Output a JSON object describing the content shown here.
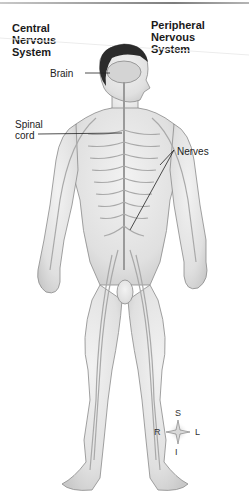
{
  "headings": {
    "central": [
      "Central",
      "Nervous",
      "System"
    ],
    "peripheral": [
      "Peripheral",
      "Nervous",
      "System"
    ]
  },
  "labels": {
    "brain": "Brain",
    "spinal_cord": [
      "Spinal",
      "cord"
    ],
    "nerves": "Nerves"
  },
  "compass": {
    "superior": "S",
    "inferior": "I",
    "right": "R",
    "left": "L"
  },
  "colors": {
    "skin": "#e6e6e6",
    "outline": "#8a8a8a",
    "nerve": "#a9a9a9",
    "hair": "#2b2b2b",
    "text": "#1a1a1a"
  }
}
